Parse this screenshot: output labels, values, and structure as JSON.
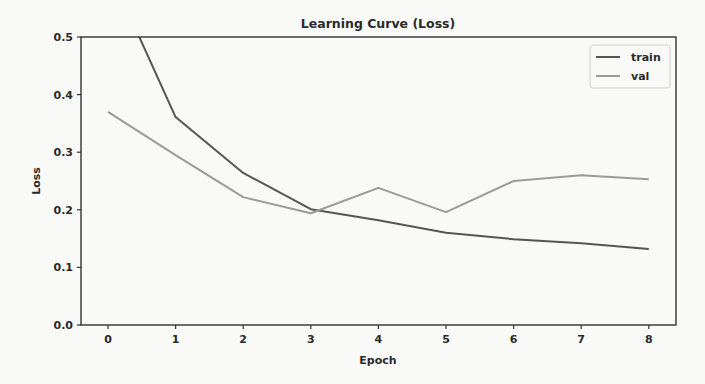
{
  "chart_data": {
    "type": "line",
    "title": "Learning Curve (Loss)",
    "xlabel": "Epoch",
    "ylabel": "Loss",
    "x": [
      0,
      1,
      2,
      3,
      4,
      5,
      6,
      7,
      8
    ],
    "xticks": [
      "0",
      "1",
      "2",
      "3",
      "4",
      "5",
      "6",
      "7",
      "8"
    ],
    "yticks": [
      "0.0",
      "0.1",
      "0.2",
      "0.3",
      "0.4",
      "0.5"
    ],
    "ylim": [
      0.0,
      0.5
    ],
    "xlim": [
      -0.4,
      8.4
    ],
    "grid": false,
    "legend_position": "upper right",
    "series": [
      {
        "name": "train",
        "color": "#555555",
        "values": [
          0.62,
          0.361,
          0.264,
          0.201,
          0.182,
          0.16,
          0.149,
          0.142,
          0.132
        ]
      },
      {
        "name": "val",
        "color": "#9a9a9a",
        "values": [
          0.37,
          0.295,
          0.222,
          0.194,
          0.238,
          0.196,
          0.25,
          0.26,
          0.253
        ]
      }
    ]
  }
}
